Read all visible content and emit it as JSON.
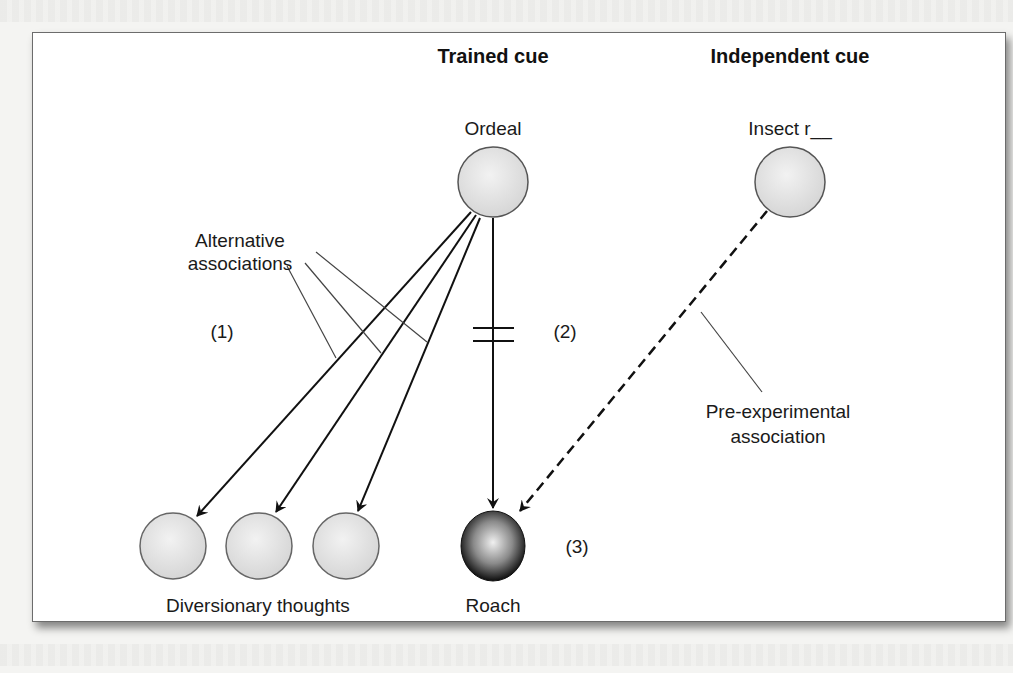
{
  "headers": {
    "trained_cue": "Trained cue",
    "independent_cue": "Independent cue"
  },
  "nodes": {
    "ordeal": "Ordeal",
    "insect": "Insect r__",
    "roach": "Roach",
    "diversionary": "Diversionary thoughts"
  },
  "labels": {
    "alt_assoc_line1": "Alternative",
    "alt_assoc_line2": "associations",
    "pre_exp_line1": "Pre-experimental",
    "pre_exp_line2": "association",
    "marker1": "(1)",
    "marker2": "(2)",
    "marker3": "(3)"
  },
  "colors": {
    "node_fill": "#e6e6e6",
    "node_stroke": "#555555",
    "roach_dark": "#111111",
    "line": "#111111",
    "callout": "#444444"
  }
}
